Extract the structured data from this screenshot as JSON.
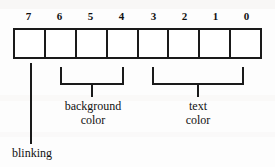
{
  "diagram": {
    "stroke_color": "#1a1a1a",
    "background_color": "#ffffff",
    "bit_count": 8,
    "bit_labels": [
      "7",
      "6",
      "5",
      "4",
      "3",
      "2",
      "1",
      "0"
    ],
    "cells": [
      {
        "bit": "7",
        "value": ""
      },
      {
        "bit": "6",
        "value": ""
      },
      {
        "bit": "5",
        "value": ""
      },
      {
        "bit": "4",
        "value": ""
      },
      {
        "bit": "3",
        "value": ""
      },
      {
        "bit": "2",
        "value": ""
      },
      {
        "bit": "1",
        "value": ""
      },
      {
        "bit": "0",
        "value": ""
      }
    ],
    "annotations": {
      "blinking": {
        "label": "blinking",
        "bits": "7",
        "connector": "line"
      },
      "background_color": {
        "label_line1": "background",
        "label_line2": "color",
        "bits": "6-4",
        "connector": "bracket"
      },
      "text_color": {
        "label_line1": "text",
        "label_line2": "color",
        "bits": "3-0",
        "connector": "bracket"
      }
    }
  }
}
